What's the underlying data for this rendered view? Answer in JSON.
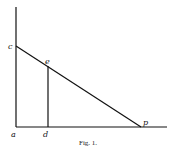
{
  "figure": {
    "caption": "Fig. 1.",
    "points": {
      "a": {
        "label": "a",
        "x": 16,
        "y": 127
      },
      "c": {
        "label": "c",
        "x": 16,
        "y": 46
      },
      "e": {
        "label": "e",
        "x": 48,
        "y": 66
      },
      "d": {
        "label": "d",
        "x": 48,
        "y": 127
      },
      "p": {
        "label": "p",
        "x": 141,
        "y": 127
      }
    },
    "lines": [
      {
        "name": "vertical-axis",
        "from": [
          16,
          7
        ],
        "to": [
          16,
          127
        ]
      },
      {
        "name": "horizontal-axis",
        "from": [
          16,
          127
        ],
        "to": [
          167,
          127
        ]
      },
      {
        "name": "line-cp",
        "from": [
          16,
          46
        ],
        "to": [
          141,
          127
        ]
      },
      {
        "name": "line-ed",
        "from": [
          48,
          66
        ],
        "to": [
          48,
          127
        ]
      }
    ]
  }
}
